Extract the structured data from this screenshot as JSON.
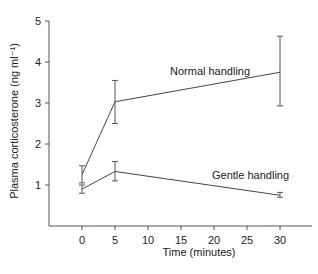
{
  "chart_data": {
    "type": "line",
    "title": "",
    "xlabel": "Time (minutes)",
    "ylabel": "Plasma corticosterone (ng ml⁻¹)",
    "x": [
      0,
      5,
      30
    ],
    "xticks": [
      0,
      5,
      10,
      15,
      20,
      25,
      30
    ],
    "yticks": [
      1,
      2,
      3,
      4,
      5
    ],
    "xlim": [
      -10,
      40
    ],
    "ylim": [
      0,
      5
    ],
    "grid": false,
    "legend": "inline labels",
    "series": [
      {
        "name": "Normal handling",
        "values": [
          1.25,
          3.03,
          3.75
        ],
        "error_low": [
          1.05,
          2.5,
          2.93
        ],
        "error_high": [
          1.47,
          3.55,
          4.63
        ],
        "label_pos": {
          "x": 170,
          "y": 75
        }
      },
      {
        "name": "Gentle handling",
        "values": [
          0.9,
          1.33,
          0.75
        ],
        "error_low": [
          0.8,
          1.1,
          0.7
        ],
        "error_high": [
          1.0,
          1.57,
          0.82
        ],
        "label_pos": {
          "x": 212,
          "y": 179
        }
      }
    ]
  }
}
